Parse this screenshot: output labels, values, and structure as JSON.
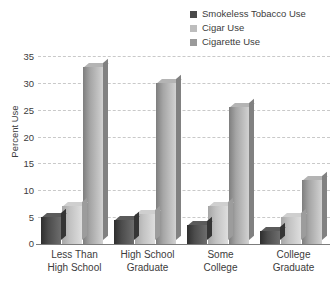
{
  "chart_data": {
    "type": "bar",
    "title": "",
    "xlabel": "",
    "ylabel": "Percent Use",
    "ylim": [
      0,
      35
    ],
    "yticks": [
      0,
      5,
      10,
      15,
      20,
      25,
      30,
      35
    ],
    "grid": true,
    "legend_position": "top-right",
    "categories": [
      "Less Than\nHigh School",
      "High School\nGraduate",
      "Some\nCollege",
      "College\nGraduate"
    ],
    "category_lines": [
      [
        "Less Than",
        "High School"
      ],
      [
        "High School",
        "Graduate"
      ],
      [
        "Some",
        "College"
      ],
      [
        "College",
        "Graduate"
      ]
    ],
    "series": [
      {
        "name": "Smokeless Tobacco Use",
        "color": "#4a4a4a",
        "values": [
          5,
          4.5,
          3.5,
          2.5
        ]
      },
      {
        "name": "Cigar Use",
        "color": "#bdbdbd",
        "values": [
          7,
          5.5,
          7,
          5
        ]
      },
      {
        "name": "Cigarette Use",
        "color": "#9a9a9a",
        "values": [
          33,
          30,
          25.5,
          12
        ]
      }
    ]
  },
  "legend": {
    "items": [
      {
        "label": "Smokeless Tobacco Use"
      },
      {
        "label": "Cigar Use"
      },
      {
        "label": "Cigarette Use"
      }
    ]
  },
  "axes": {
    "y_title": "Percent Use",
    "y_ticks": [
      "35",
      "30",
      "25",
      "20",
      "15",
      "10",
      "5",
      "0"
    ]
  }
}
